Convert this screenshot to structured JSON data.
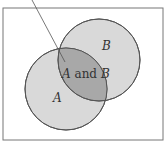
{
  "diagram": {
    "type": "venn",
    "labels": {
      "a": "A",
      "b": "B",
      "and_word": " and ",
      "intersection_a": "A",
      "intersection_b": "B"
    },
    "colors": {
      "circle_fill": "#d9d9d9",
      "intersection_fill": "#a8a8a8",
      "stroke": "#555555",
      "frame": "#777777"
    }
  }
}
